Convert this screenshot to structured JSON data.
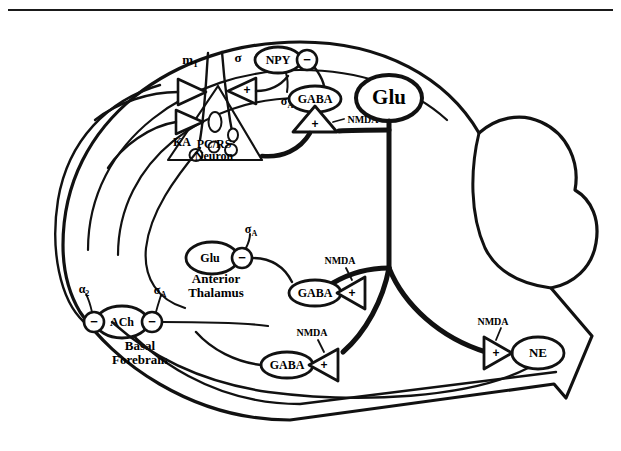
{
  "figure": {
    "top_rule": true
  },
  "nodes": {
    "npy": {
      "label": "NPY"
    },
    "gaba_cortex": {
      "label": "GABA"
    },
    "glu_main": {
      "label": "Glu"
    },
    "glu_thalamus": {
      "label": "Glu"
    },
    "gaba_mid": {
      "label": "GABA"
    },
    "gaba_lower": {
      "label": "GABA"
    },
    "ach": {
      "label": "ACh"
    },
    "ne": {
      "label": "NE"
    }
  },
  "regions": {
    "pc_rs_neuron": {
      "line1": "PC/RS",
      "line2": "Neuron"
    },
    "anterior_thalamus": {
      "line1": "Anterior",
      "line2": "Thalamus"
    },
    "basal_forebrain": {
      "line1": "Basal",
      "line2": "Forebrain"
    }
  },
  "receptors": {
    "m1": "m",
    "m1_sub": "1",
    "sigma": "σ",
    "ka": "KA",
    "sigma_a_npy": "σ",
    "sigma_a_npy_sub": "A",
    "alpha_a_thal": "σ",
    "alpha_a_thal_sub": "A",
    "alpha2_ach": "α",
    "alpha2_ach_sub": "2",
    "alpha_a_ach": "σ",
    "alpha_a_ach_sub": "A",
    "nmda_cortex": "NMDA",
    "nmda_mid": "NMDA",
    "nmda_lower": "NMDA",
    "nmda_ne": "NMDA"
  },
  "signs": {
    "plus": "+",
    "minus": "−"
  },
  "synapse_signs": {
    "npy_minus": "−",
    "gaba_cortex_plus": "+",
    "gaba_mid_plus": "+",
    "gaba_lower_plus": "+",
    "ne_plus": "+",
    "ach_left_minus": "−",
    "ach_right_minus": "−",
    "thal_glu_minus": "−",
    "pyr_sigma_plus": "+"
  },
  "colors": {
    "ink": "#111111",
    "paper": "#ffffff"
  }
}
